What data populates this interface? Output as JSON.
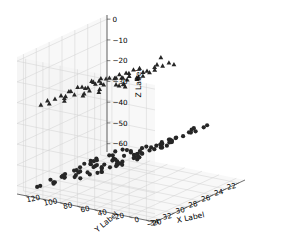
{
  "figure": {
    "kind": "3d-scatter",
    "background": "#ffffff",
    "pane_fill": "#f2f2f2",
    "grid_color": "#d0d0d0",
    "axis_line_color": "#4d4d4d",
    "marker_color": "#262626",
    "width": 293,
    "height": 236
  },
  "axes": {
    "x": {
      "label": "X Label",
      "ticks": [
        "22",
        "24",
        "26",
        "28",
        "30",
        "32",
        "34"
      ],
      "values": [
        22,
        24,
        26,
        28,
        30,
        32,
        34
      ],
      "lim": [
        21,
        35
      ]
    },
    "y": {
      "label": "Y Label",
      "ticks": [
        "−20",
        "0",
        "20",
        "40",
        "60",
        "80",
        "100",
        "120"
      ],
      "values": [
        -20,
        0,
        20,
        40,
        60,
        80,
        100,
        120
      ],
      "lim": [
        -30,
        130
      ]
    },
    "z": {
      "label": "Z Label",
      "ticks": [
        "0",
        "−10",
        "−20",
        "−30",
        "−40",
        "−50",
        "−60"
      ],
      "values": [
        0,
        -10,
        -20,
        -30,
        -40,
        -50,
        -60
      ],
      "lim": [
        2,
        -64
      ]
    }
  },
  "chart_data": {
    "type": "scatter",
    "title": "",
    "xlabel": "X Label",
    "ylabel": "Y Label",
    "zlabel": "Z Label",
    "xlim": [
      21,
      35
    ],
    "ylim": [
      -30,
      130
    ],
    "zlim": [
      -64,
      2
    ],
    "grid": true,
    "legend": "none",
    "projection": "3d",
    "elev": 20,
    "azim": -60,
    "series": [
      {
        "name": "triangles",
        "marker": "^",
        "color": "#262626",
        "points": [
          [
            25.9,
            31,
            -3
          ],
          [
            27.2,
            12,
            -2
          ],
          [
            26.3,
            26,
            -6
          ],
          [
            25.3,
            40,
            -8
          ],
          [
            27.0,
            36,
            -9
          ],
          [
            28.6,
            18,
            -4
          ],
          [
            29.8,
            30,
            -7
          ],
          [
            26.0,
            55,
            -10
          ],
          [
            24.6,
            48,
            -11
          ],
          [
            30.6,
            22,
            -5
          ],
          [
            31.4,
            42,
            -9
          ],
          [
            28.1,
            60,
            -12
          ],
          [
            25.2,
            68,
            -13
          ],
          [
            27.6,
            72,
            -14
          ],
          [
            29.0,
            52,
            -10
          ],
          [
            32.0,
            34,
            -8
          ],
          [
            23.9,
            62,
            -15
          ],
          [
            26.8,
            84,
            -16
          ],
          [
            30.1,
            66,
            -13
          ],
          [
            31.8,
            58,
            -12
          ],
          [
            28.9,
            78,
            -15
          ],
          [
            24.3,
            80,
            -17
          ],
          [
            27.9,
            92,
            -18
          ],
          [
            33.0,
            50,
            -11
          ],
          [
            25.7,
            96,
            -19
          ],
          [
            29.6,
            88,
            -17
          ],
          [
            32.6,
            70,
            -14
          ],
          [
            22.9,
            74,
            -18
          ],
          [
            30.9,
            94,
            -19
          ],
          [
            26.6,
            104,
            -20
          ],
          [
            28.4,
            100,
            -20
          ],
          [
            33.6,
            64,
            -13
          ],
          [
            24.9,
            108,
            -21
          ],
          [
            31.2,
            102,
            -20
          ],
          [
            27.3,
            112,
            -22
          ],
          [
            29.3,
            110,
            -21
          ],
          [
            23.4,
            90,
            -19
          ],
          [
            32.2,
            96,
            -19
          ],
          [
            25.0,
            118,
            -23
          ],
          [
            30.3,
            114,
            -22
          ],
          [
            28.0,
            122,
            -24
          ],
          [
            33.2,
            106,
            -21
          ],
          [
            26.1,
            126,
            -25
          ],
          [
            31.6,
            120,
            -23
          ],
          [
            24.1,
            116,
            -24
          ],
          [
            29.9,
            124,
            -25
          ],
          [
            27.5,
            46,
            -12
          ],
          [
            30.7,
            78,
            -16
          ],
          [
            23.1,
            100,
            -21
          ],
          [
            32.9,
            118,
            -23
          ],
          [
            26.4,
            64,
            -14
          ],
          [
            28.7,
            38,
            -10
          ],
          [
            25.5,
            86,
            -18
          ],
          [
            31.0,
            36,
            -9
          ],
          [
            29.1,
            28,
            -7
          ],
          [
            33.8,
            84,
            -17
          ],
          [
            24.0,
            30,
            -9
          ],
          [
            27.8,
            56,
            -13
          ],
          [
            30.0,
            44,
            -11
          ],
          [
            32.4,
            24,
            -7
          ]
        ]
      },
      {
        "name": "circles",
        "marker": "o",
        "color": "#262626",
        "points": [
          [
            22.6,
            2,
            -38
          ],
          [
            23.4,
            14,
            -40
          ],
          [
            24.2,
            -6,
            -36
          ],
          [
            25.0,
            20,
            -42
          ],
          [
            25.8,
            6,
            -39
          ],
          [
            26.4,
            28,
            -44
          ],
          [
            27.0,
            -12,
            -34
          ],
          [
            27.8,
            16,
            -41
          ],
          [
            28.4,
            34,
            -46
          ],
          [
            29.0,
            8,
            -40
          ],
          [
            29.8,
            24,
            -43
          ],
          [
            30.4,
            -4,
            -37
          ],
          [
            31.2,
            18,
            -42
          ],
          [
            31.8,
            38,
            -47
          ],
          [
            32.4,
            10,
            -41
          ],
          [
            33.0,
            30,
            -45
          ],
          [
            22.9,
            44,
            -48
          ],
          [
            23.8,
            36,
            -46
          ],
          [
            24.6,
            52,
            -50
          ],
          [
            25.4,
            40,
            -47
          ],
          [
            26.2,
            60,
            -52
          ],
          [
            27.2,
            48,
            -49
          ],
          [
            28.0,
            66,
            -53
          ],
          [
            28.8,
            54,
            -51
          ],
          [
            29.6,
            72,
            -54
          ],
          [
            30.2,
            58,
            -52
          ],
          [
            31.0,
            78,
            -55
          ],
          [
            31.6,
            62,
            -53
          ],
          [
            32.2,
            84,
            -56
          ],
          [
            33.2,
            70,
            -54
          ],
          [
            22.4,
            56,
            -51
          ],
          [
            23.2,
            68,
            -53
          ],
          [
            24.0,
            80,
            -55
          ],
          [
            24.8,
            74,
            -54
          ],
          [
            25.6,
            88,
            -57
          ],
          [
            26.6,
            82,
            -56
          ],
          [
            27.4,
            94,
            -58
          ],
          [
            28.2,
            90,
            -57
          ],
          [
            29.2,
            100,
            -59
          ],
          [
            30.0,
            96,
            -58
          ],
          [
            30.8,
            106,
            -60
          ],
          [
            31.4,
            102,
            -59
          ],
          [
            32.0,
            110,
            -61
          ],
          [
            32.8,
            104,
            -60
          ],
          [
            23.0,
            92,
            -57
          ],
          [
            23.6,
            108,
            -60
          ],
          [
            24.4,
            98,
            -58
          ],
          [
            25.2,
            114,
            -61
          ],
          [
            26.0,
            112,
            -61
          ],
          [
            26.8,
            118,
            -62
          ],
          [
            27.6,
            116,
            -62
          ],
          [
            28.6,
            122,
            -63
          ],
          [
            29.4,
            120,
            -63
          ],
          [
            30.6,
            124,
            -63
          ],
          [
            22.2,
            26,
            -44
          ],
          [
            33.6,
            42,
            -48
          ],
          [
            24.4,
            4,
            -37
          ],
          [
            26.0,
            -10,
            -35
          ],
          [
            28.2,
            2,
            -38
          ],
          [
            30.2,
            -8,
            -36
          ],
          [
            32.6,
            50,
            -50
          ],
          [
            22.8,
            76,
            -55
          ],
          [
            25.0,
            62,
            -52
          ],
          [
            27.0,
            104,
            -59
          ],
          [
            29.0,
            86,
            -56
          ],
          [
            31.2,
            90,
            -57
          ],
          [
            33.4,
            98,
            -58
          ],
          [
            24.2,
            42,
            -48
          ],
          [
            26.4,
            70,
            -53
          ],
          [
            28.8,
            110,
            -60
          ],
          [
            30.4,
            66,
            -53
          ],
          [
            32.4,
            126,
            -64
          ],
          [
            23.8,
            128,
            -64
          ],
          [
            25.8,
            106,
            -59
          ],
          [
            27.2,
            74,
            -54
          ],
          [
            29.6,
            34,
            -46
          ],
          [
            31.8,
            12,
            -41
          ],
          [
            22.4,
            110,
            -60
          ],
          [
            33.0,
            118,
            -62
          ],
          [
            25.4,
            22,
            -43
          ],
          [
            27.8,
            30,
            -45
          ],
          [
            30.0,
            114,
            -61
          ],
          [
            24.8,
            128,
            -64
          ],
          [
            29.2,
            14,
            -41
          ],
          [
            26.8,
            52,
            -50
          ],
          [
            31.0,
            44,
            -48
          ],
          [
            23.2,
            34,
            -46
          ],
          [
            32.8,
            62,
            -52
          ],
          [
            28.4,
            78,
            -55
          ],
          [
            26.2,
            16,
            -42
          ],
          [
            30.8,
            26,
            -44
          ],
          [
            24.0,
            120,
            -62
          ],
          [
            27.4,
            10,
            -40
          ],
          [
            29.8,
            50,
            -50
          ],
          [
            22.6,
            100,
            -58
          ],
          [
            33.4,
            20,
            -43
          ]
        ]
      }
    ]
  }
}
